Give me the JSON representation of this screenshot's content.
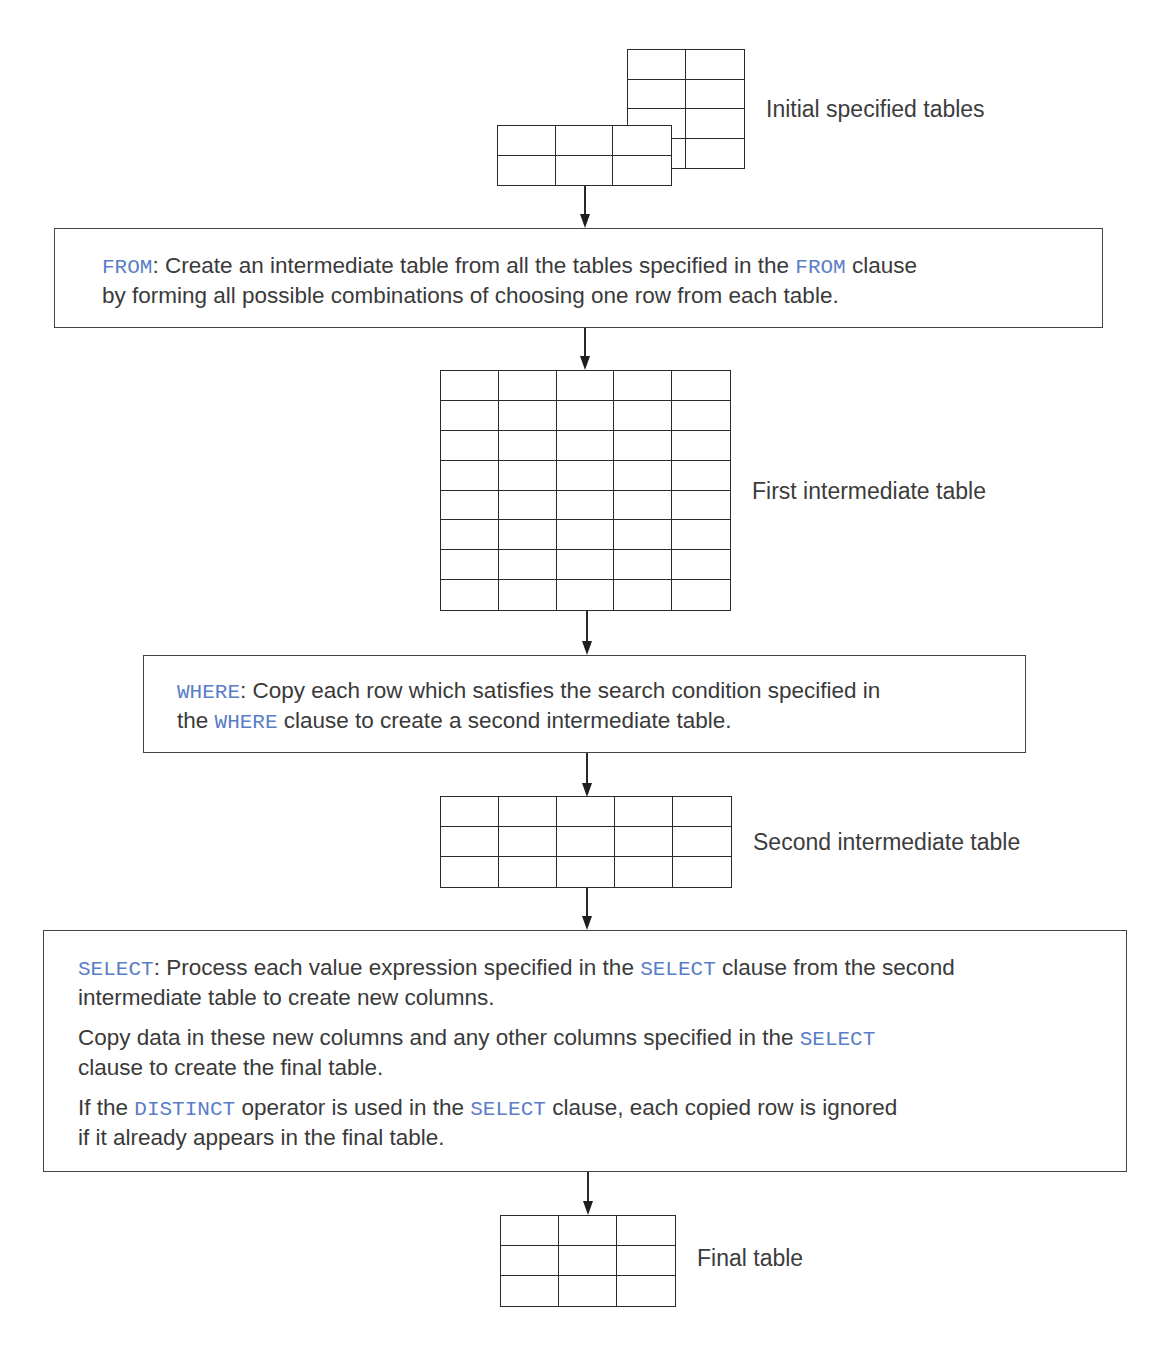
{
  "figure": {
    "keyword_color": "#5a7dc8",
    "tables": {
      "initial_back": {
        "label": "",
        "cols": 2,
        "rows": 4
      },
      "initial_front": {
        "label": "Initial specified tables",
        "cols": 3,
        "rows": 2
      },
      "first_intermediate": {
        "label": "First intermediate table",
        "cols": 5,
        "rows": 8
      },
      "second_intermediate": {
        "label": "Second intermediate table",
        "cols": 5,
        "rows": 3
      },
      "final": {
        "label": "Final table",
        "cols": 3,
        "rows": 3
      }
    },
    "steps": {
      "from": {
        "kw1": "FROM",
        "t1": ": Create an intermediate table from all the tables specified in the ",
        "kw2": "FROM",
        "t2": " clause",
        "t3": "by forming all possible combinations of choosing one row from each table."
      },
      "where": {
        "kw1": "WHERE",
        "t1": ": Copy each row which satisfies the search condition specified in",
        "t2": "the ",
        "kw2": "WHERE",
        "t3": " clause to create a second intermediate table."
      },
      "select": {
        "p1": {
          "kw1": "SELECT",
          "t1": ": Process each value expression specified in the ",
          "kw2": "SELECT",
          "t2": " clause from the second",
          "t3": "intermediate table to create new columns."
        },
        "p2": {
          "t1": "Copy data in these new columns and any other columns specified in the ",
          "kw1": "SELECT",
          "t2": "clause to create the final table."
        },
        "p3": {
          "t1": "If the ",
          "kw1": "DISTINCT",
          "t2": " operator is used in the ",
          "kw2": "SELECT",
          "t3": " clause, each copied row is ignored",
          "t4": "if it already appears in the final table."
        }
      }
    }
  }
}
